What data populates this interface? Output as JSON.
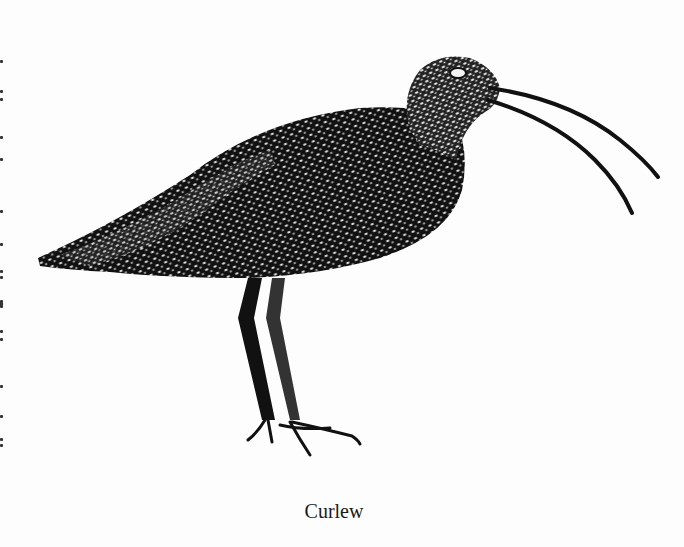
{
  "figure": {
    "caption": "Curlew",
    "style": "stippled black-and-white engraving",
    "colors": {
      "ink": "#111111",
      "paper": "#fdfdfd"
    }
  }
}
